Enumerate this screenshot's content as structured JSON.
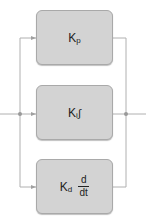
{
  "diagram": {
    "blocks": [
      {
        "id": "proportional",
        "symbol": "K",
        "subscript": "p",
        "operator": ""
      },
      {
        "id": "integral",
        "symbol": "K",
        "subscript": "i",
        "operator": "∫"
      },
      {
        "id": "derivative",
        "symbol": "K",
        "subscript": "d",
        "operator_num": "d",
        "operator_den": "dt"
      }
    ],
    "colors": {
      "block_fill": "#d3d3d3",
      "block_border": "#a9a9a9",
      "wire": "#b0b0b0",
      "junction": "#999999"
    }
  }
}
